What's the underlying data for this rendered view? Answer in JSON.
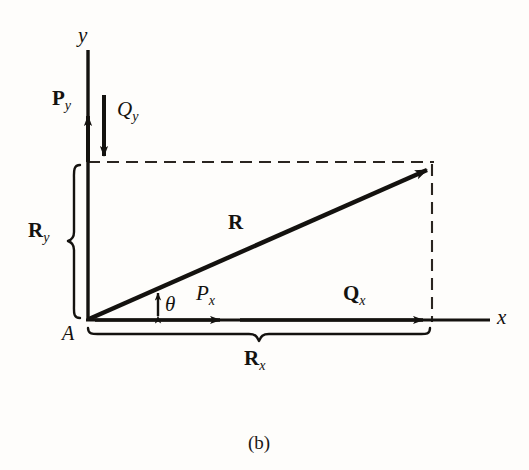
{
  "figure": {
    "caption": "(b)",
    "type": "vector-resolution-diagram",
    "background_color": "#fefdfb",
    "ink_color": "#14120f"
  },
  "axes": {
    "x_label": "x",
    "y_label": "y",
    "origin_label": "A",
    "origin": {
      "x": 88,
      "y": 320
    },
    "x_axis_end": {
      "x": 490,
      "y": 320
    },
    "y_axis_top": {
      "x": 88,
      "y": 50
    }
  },
  "vectors": [
    {
      "name": "resultant",
      "label": "R",
      "subscript": "",
      "style": "bold",
      "from": {
        "x": 88,
        "y": 320
      },
      "to": {
        "x": 432,
        "y": 167
      },
      "label_pos": {
        "x": 228,
        "y": 212
      }
    },
    {
      "name": "p-vertical-component",
      "label": "P",
      "subscript": "y",
      "style": "bold",
      "direction": "up",
      "from": {
        "x": 88,
        "y": 162
      },
      "to": {
        "x": 88,
        "y": 108
      },
      "label_pos": {
        "x": 52,
        "y": 88
      }
    },
    {
      "name": "q-vertical-component",
      "label": "Q",
      "subscript": "y",
      "style": "italic",
      "direction": "down",
      "from": {
        "x": 104,
        "y": 95
      },
      "to": {
        "x": 104,
        "y": 163
      },
      "label_pos": {
        "x": 117,
        "y": 99
      }
    },
    {
      "name": "p-horizontal-component",
      "label": "P",
      "subscript": "x",
      "style": "italic",
      "direction": "right",
      "from": {
        "x": 88,
        "y": 320
      },
      "to": {
        "x": 228,
        "y": 320
      },
      "label_pos": {
        "x": 196,
        "y": 283
      }
    },
    {
      "name": "q-horizontal-component",
      "label": "Q",
      "subscript": "x",
      "style": "bold",
      "direction": "right",
      "from": {
        "x": 228,
        "y": 320
      },
      "to": {
        "x": 431,
        "y": 320
      },
      "label_pos": {
        "x": 343,
        "y": 283
      }
    }
  ],
  "angle": {
    "symbol": "θ",
    "label_pos": {
      "x": 165,
      "y": 294
    },
    "marker_x": 158,
    "marker_top_y": 292,
    "marker_bottom_y": 318
  },
  "braces": [
    {
      "name": "ry-brace",
      "label": "R",
      "subscript": "y",
      "orientation": "vertical",
      "from": {
        "x": 72,
        "y": 165
      },
      "to": {
        "x": 72,
        "y": 318
      },
      "label_pos": {
        "x": 30,
        "y": 220
      }
    },
    {
      "name": "rx-brace",
      "label": "R",
      "subscript": "x",
      "orientation": "horizontal",
      "from": {
        "x": 88,
        "y": 335
      },
      "to": {
        "x": 430,
        "y": 335
      },
      "label_pos": {
        "x": 244,
        "y": 348
      }
    }
  ],
  "construction_lines": [
    {
      "name": "top-dashed-projection",
      "style": "dashed",
      "from": {
        "x": 88,
        "y": 162
      },
      "to": {
        "x": 432,
        "y": 162
      }
    },
    {
      "name": "right-dashed-projection",
      "style": "dashed",
      "from": {
        "x": 432,
        "y": 167
      },
      "to": {
        "x": 432,
        "y": 320
      }
    }
  ]
}
